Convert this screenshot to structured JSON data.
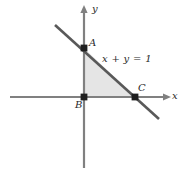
{
  "figure": {
    "background_color": "#ffffff"
  },
  "axes": {
    "x_label": "x",
    "y_label": "y",
    "axis_color": "#808080",
    "x_axis": {
      "x1": 10,
      "y1": 97,
      "x2": 170,
      "y2": 97
    },
    "y_axis": {
      "x1": 84,
      "y1": 6,
      "x2": 84,
      "y2": 168
    },
    "x_label_pos": {
      "x": 172,
      "y": 92
    },
    "y_label_pos": {
      "x": 91,
      "y": 5
    }
  },
  "line": {
    "equation_label": "x + y = 1",
    "equation_label_pos": {
      "x": 102,
      "y": 54
    },
    "color": "#595959",
    "x1": 55,
    "y1": 25,
    "x2": 159,
    "y2": 119
  },
  "region": {
    "name": "shaded-triangle",
    "fill_color": "#e2e2e2",
    "opacity": 0.85
  },
  "points": [
    {
      "id": "A",
      "label": "A",
      "cx": 84,
      "cy": 48,
      "label_x": 89,
      "label_y": 39,
      "description": "y-intercept of the line x + y = 1"
    },
    {
      "id": "B",
      "label": "B",
      "cx": 84,
      "cy": 97,
      "label_x": 76,
      "label_y": 100,
      "description": "origin"
    },
    {
      "id": "C",
      "label": "C",
      "cx": 135,
      "cy": 97,
      "label_x": 138,
      "label_y": 84,
      "description": "x-intercept of the line x + y = 1"
    }
  ],
  "chart_data": {
    "type": "line",
    "title": "",
    "xlabel": "x",
    "ylabel": "y",
    "grid": false,
    "legend": "none",
    "annotations": [
      "x + y = 1",
      "A",
      "B",
      "C"
    ],
    "series": [
      {
        "name": "x + y = 1",
        "x": [
          -0.6,
          1.5
        ],
        "y": [
          1.6,
          -0.5
        ]
      }
    ],
    "markers": [
      {
        "label": "A",
        "x": 0,
        "y": 1
      },
      {
        "label": "B",
        "x": 0,
        "y": 0
      },
      {
        "label": "C",
        "x": 1,
        "y": 0
      }
    ],
    "shaded_region": {
      "label": "triangle ABC",
      "vertices": [
        [
          0,
          1
        ],
        [
          0,
          0
        ],
        [
          1,
          0
        ]
      ]
    },
    "xlim": [
      -1.65,
      1.7
    ],
    "ylim": [
      -1.45,
      1.85
    ]
  }
}
